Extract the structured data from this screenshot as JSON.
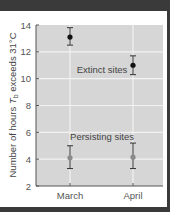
{
  "chart_data": {
    "type": "scatter",
    "title": "",
    "xlabel": "",
    "ylabel": "Number of hours T_b exceeds 31°C",
    "ylabel_parts": {
      "pre": "Number of hours ",
      "T": "T",
      "sub": "b",
      "post": " exceeds 31°C"
    },
    "categories": [
      "March",
      "April"
    ],
    "ylim": [
      2,
      14
    ],
    "yticks": [
      "2",
      "4",
      "6",
      "8",
      "10",
      "12",
      "14"
    ],
    "grid": true,
    "series": [
      {
        "name": "Extinct sites",
        "color": "#111111",
        "values": [
          13.1,
          11.0
        ],
        "err_low": [
          12.5,
          10.3
        ],
        "err_high": [
          13.8,
          11.7
        ]
      },
      {
        "name": "Persisting sites",
        "color": "#8a8a8a",
        "values": [
          4.1,
          4.15
        ],
        "err_low": [
          3.3,
          3.3
        ],
        "err_high": [
          5.0,
          5.2
        ]
      }
    ],
    "annotations": [
      "Extinct sites",
      "Persisting sites"
    ]
  },
  "colors": {
    "plot_bg": "#d6d6d6",
    "grid": "#f2f2f2",
    "frame": "#3a3a3a"
  }
}
